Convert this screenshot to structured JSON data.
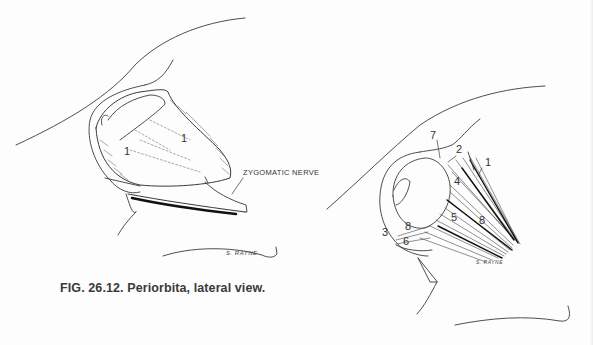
{
  "figure": {
    "caption": "FIG. 26.12.  Periorbita, lateral view.",
    "left_view": {
      "labels": [
        {
          "text": "1",
          "x": 124,
          "y": 152
        },
        {
          "text": "1",
          "x": 181,
          "y": 139
        }
      ],
      "callout": "ZYGOMATIC NERVE",
      "signature": "S. RAYNE"
    },
    "right_view": {
      "labels": [
        {
          "text": "7",
          "x": 430,
          "y": 136
        },
        {
          "text": "2",
          "x": 456,
          "y": 150
        },
        {
          "text": "1",
          "x": 485,
          "y": 163
        },
        {
          "text": "4",
          "x": 454,
          "y": 182
        },
        {
          "text": "5",
          "x": 451,
          "y": 218
        },
        {
          "text": "8",
          "x": 479,
          "y": 221
        },
        {
          "text": "8",
          "x": 405,
          "y": 227
        },
        {
          "text": "3",
          "x": 382,
          "y": 233
        },
        {
          "text": "6",
          "x": 403,
          "y": 242
        }
      ],
      "signature": "S. RAYNE"
    }
  },
  "colors": {
    "ink": "#333333",
    "paper": "#fdfdfd"
  }
}
